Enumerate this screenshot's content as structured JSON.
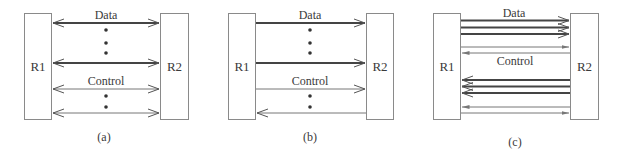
{
  "diagram": {
    "type": "router-link-configurations",
    "panels": [
      {
        "id": "a",
        "caption": "(a)",
        "left_node": "R1",
        "right_node": "R2",
        "data_label": "Data",
        "control_label": "Control",
        "data_links": [
          {
            "direction": "bidirectional"
          },
          {
            "direction": "bidirectional"
          }
        ],
        "control_links": [
          {
            "direction": "bidirectional"
          },
          {
            "direction": "bidirectional"
          }
        ],
        "ellipsis_between_data": true,
        "ellipsis_between_control": true
      },
      {
        "id": "b",
        "caption": "(b)",
        "left_node": "R1",
        "right_node": "R2",
        "data_label": "Data",
        "control_label": "Control",
        "data_links": [
          {
            "direction": "R1-to-R2"
          },
          {
            "direction": "R1-to-R2"
          }
        ],
        "control_links": [
          {
            "direction": "R1-to-R2"
          },
          {
            "direction": "R2-to-R1"
          }
        ],
        "ellipsis_between_data": true,
        "ellipsis_between_control": true
      },
      {
        "id": "c",
        "caption": "(c)",
        "left_node": "R1",
        "right_node": "R2",
        "data_label": "Data",
        "control_label": "Control",
        "data_links_r1_to_r2": 3,
        "control_links_upper": [
          {
            "direction": "R1-to-R2"
          },
          {
            "direction": "R2-to-R1"
          }
        ],
        "data_links_r2_to_r1": 3,
        "control_links_lower": [
          {
            "direction": "R2-to-R1"
          },
          {
            "direction": "R1-to-R2"
          }
        ]
      }
    ],
    "colors": {
      "box_stroke": "#8a8a8a",
      "thick_line": "#444444",
      "thin_line": "#777777",
      "text": "#3a3a3a"
    }
  }
}
